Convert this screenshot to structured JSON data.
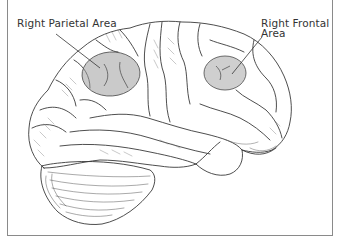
{
  "figure": {
    "labels": {
      "parietal": {
        "line1": "Right Parietal Area"
      },
      "frontal": {
        "line1": "Right Frontal",
        "line2": "Area"
      }
    },
    "highlight_regions": [
      {
        "name": "Right Parietal Area",
        "cx": 111,
        "cy": 74,
        "rx": 29,
        "ry": 22
      },
      {
        "name": "Right Frontal Area",
        "cx": 225,
        "cy": 73,
        "rx": 21,
        "ry": 17
      }
    ],
    "colors": {
      "highlight_fill": "#b8b8b8",
      "line": "#333333",
      "frame": "#8a8a8a",
      "background": "#ffffff"
    }
  }
}
